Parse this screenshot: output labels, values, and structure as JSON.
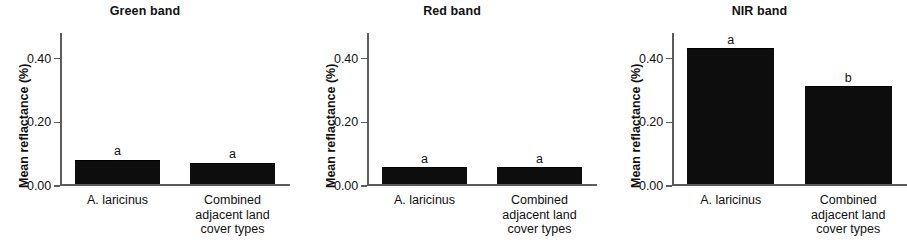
{
  "figure": {
    "ylabel": "Mean reflactance (%)",
    "y_ticklabels": [
      "0.00",
      "0.20",
      "0.40"
    ],
    "y_tickvalues": [
      0.0,
      0.2,
      0.4
    ],
    "ylim": [
      0.0,
      0.48
    ],
    "categories": [
      {
        "lines": [
          "A. laricinus"
        ]
      },
      {
        "lines": [
          "Combined",
          "adjacent land",
          "cover types"
        ]
      }
    ],
    "bar_color": "#0d0d0d",
    "axis_color": "#5d5d5d"
  },
  "panels": [
    {
      "title": "Green band",
      "letters": [
        "a",
        "a"
      ],
      "values": [
        0.075,
        0.065
      ]
    },
    {
      "title": "Red band",
      "letters": [
        "a",
        "a"
      ],
      "values": [
        0.05,
        0.05
      ]
    },
    {
      "title": "NIR band",
      "letters": [
        "a",
        "b"
      ],
      "values": [
        0.425,
        0.305
      ]
    }
  ],
  "chart_data": {
    "type": "bar",
    "xlabel": "",
    "ylabel": "Mean reflactance (%)",
    "ylim": [
      0.0,
      0.48
    ],
    "yticks": [
      0.0,
      0.2,
      0.4
    ],
    "yticklabels": [
      "0.00",
      "0.20",
      "0.40"
    ],
    "grid": false,
    "legend": "none",
    "panels": [
      {
        "title": "Green band",
        "categories": [
          "A. laricinus",
          "Combined adjacent land cover types"
        ],
        "values": [
          0.075,
          0.065
        ],
        "annotations": [
          "a",
          "a"
        ]
      },
      {
        "title": "Red band",
        "categories": [
          "A. laricinus",
          "Combined adjacent land cover types"
        ],
        "values": [
          0.05,
          0.05
        ],
        "annotations": [
          "a",
          "a"
        ]
      },
      {
        "title": "NIR band",
        "categories": [
          "A. laricinus",
          "Combined adjacent land cover types"
        ],
        "values": [
          0.425,
          0.305
        ],
        "annotations": [
          "a",
          "b"
        ]
      }
    ]
  }
}
